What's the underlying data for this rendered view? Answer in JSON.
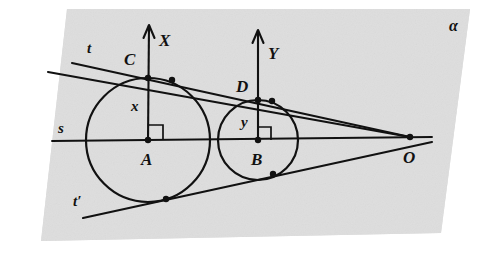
{
  "figure": {
    "type": "geometry-diagram",
    "width": 478,
    "height": 254,
    "background_color": "#ffffff",
    "plane_fill": "#dedede",
    "ink_color": "#111111"
  },
  "plane": {
    "label": "α",
    "label_x": 449,
    "label_y": 18,
    "corners": [
      [
        67,
        9
      ],
      [
        470,
        9
      ],
      [
        441,
        233
      ],
      [
        41,
        241
      ]
    ]
  },
  "circles": [
    {
      "name": "circle-A",
      "center_label": "A",
      "cx": 148,
      "cy": 140,
      "r": 62,
      "label_x": 141,
      "label_y": 151
    },
    {
      "name": "circle-B",
      "center_label": "B",
      "cx": 258,
      "cy": 140,
      "r": 40,
      "label_x": 251,
      "label_y": 151
    }
  ],
  "points": [
    {
      "name": "A",
      "label": "A",
      "x": 148,
      "y": 140,
      "label_x": 141,
      "label_y": 151,
      "dot": true
    },
    {
      "name": "B",
      "label": "B",
      "x": 258,
      "y": 140,
      "label_x": 251,
      "label_y": 151,
      "dot": true
    },
    {
      "name": "C",
      "label": "C",
      "x": 148,
      "y": 78,
      "label_x": 124,
      "label_y": 51,
      "dot": true
    },
    {
      "name": "D",
      "label": "D",
      "x": 258,
      "y": 100,
      "label_x": 236,
      "label_y": 78,
      "dot": true
    },
    {
      "name": "O",
      "label": "O",
      "x": 410,
      "y": 137,
      "label_x": 403,
      "label_y": 149,
      "dot": true
    },
    {
      "name": "tangency-upper-A",
      "label": "",
      "x": 172,
      "y": 80,
      "dot": true
    },
    {
      "name": "tangency-upper-B",
      "label": "",
      "x": 272,
      "y": 101,
      "dot": true
    },
    {
      "name": "tangency-lower-A",
      "label": "",
      "x": 166,
      "y": 199,
      "dot": true
    },
    {
      "name": "tangency-lower-B",
      "label": "",
      "x": 273,
      "y": 174,
      "dot": true
    }
  ],
  "axes": [
    {
      "name": "X",
      "label": "X",
      "from_x": 148,
      "from_y": 140,
      "to_x": 149,
      "to_y": 25,
      "label_x": 159,
      "label_y": 32
    },
    {
      "name": "Y",
      "label": "Y",
      "from_x": 258,
      "from_y": 140,
      "to_x": 258,
      "to_y": 30,
      "label_x": 268,
      "label_y": 45
    }
  ],
  "segments": [
    {
      "name": "x",
      "label": "x",
      "label_x": 131,
      "label_y": 99
    },
    {
      "name": "y",
      "label": "y",
      "label_x": 241,
      "label_y": 115
    }
  ],
  "lines": [
    {
      "name": "t",
      "label": "t",
      "label_x": 87,
      "label_y": 41,
      "from_x": 48,
      "from_y": 72,
      "to_x": 410,
      "to_y": 137
    },
    {
      "name": "t-inner",
      "label": "",
      "from_x": 72,
      "from_y": 63,
      "to_x": 410,
      "to_y": 137
    },
    {
      "name": "s",
      "label": "s",
      "label_x": 58,
      "label_y": 121,
      "from_x": 52,
      "from_y": 141,
      "to_x": 432,
      "to_y": 137
    },
    {
      "name": "t-prime",
      "label": "t′",
      "label_x": 73,
      "label_y": 194,
      "from_x": 83,
      "from_y": 218,
      "to_x": 432,
      "to_y": 142
    }
  ],
  "right_angles": [
    {
      "name": "right-angle-at-A",
      "x": 148,
      "y": 140,
      "size": 15,
      "dir_x": 1,
      "dir_y": -1
    },
    {
      "name": "right-angle-at-B",
      "x": 258,
      "y": 140,
      "size": 13,
      "dir_x": 1,
      "dir_y": -1
    }
  ]
}
